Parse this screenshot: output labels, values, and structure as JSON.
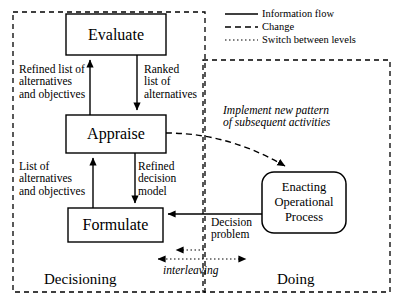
{
  "diagram": {
    "colors": {
      "ink": "#000000",
      "background": "#ffffff"
    },
    "boxes": [
      {
        "id": "evaluate",
        "label": "Evaluate",
        "shape": "rectangle"
      },
      {
        "id": "appraise",
        "label": "Appraise",
        "shape": "rectangle"
      },
      {
        "id": "formulate",
        "label": "Formulate",
        "shape": "rectangle"
      },
      {
        "id": "enacting",
        "label": "Enacting Operational Process",
        "line1": "Enacting",
        "line2": "Operational",
        "line3": "Process",
        "shape": "rounded-rectangle"
      }
    ],
    "regions": [
      {
        "id": "decisioning",
        "label": "Decisioning",
        "style": "dashed"
      },
      {
        "id": "doing",
        "label": "Doing",
        "style": "dashed"
      }
    ],
    "edge_labels": [
      {
        "id": "refined-list",
        "lines": [
          "Refined list of",
          "alternatives",
          "and objectives"
        ],
        "type": "information-flow"
      },
      {
        "id": "ranked-list",
        "lines": [
          "Ranked",
          "list of",
          "alternatives"
        ],
        "type": "information-flow"
      },
      {
        "id": "list-of-alts",
        "lines": [
          "List of",
          "alternatives",
          "and objectives"
        ],
        "type": "information-flow"
      },
      {
        "id": "refined-model",
        "lines": [
          "Refined",
          "decision",
          "model"
        ],
        "type": "information-flow"
      },
      {
        "id": "decision-problem",
        "lines": [
          "Decision",
          "problem"
        ],
        "type": "information-flow"
      },
      {
        "id": "implement-pattern",
        "lines": [
          "Implement new pattern",
          "of subsequent activities"
        ],
        "type": "change",
        "italic": true
      },
      {
        "id": "interleaving",
        "lines": [
          "interleaving"
        ],
        "type": "switch-between-levels",
        "italic": true
      }
    ],
    "legend": {
      "items": [
        {
          "id": "information-flow",
          "label": "Information flow",
          "line_style": "solid"
        },
        {
          "id": "change",
          "label": "Change",
          "line_style": "dashed"
        },
        {
          "id": "switch-between-levels",
          "label": "Switch between levels",
          "line_style": "dotted"
        }
      ]
    }
  }
}
